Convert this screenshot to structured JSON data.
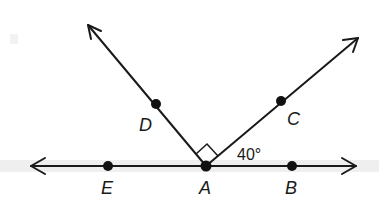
{
  "diagram": {
    "type": "geometry-angles",
    "colors": {
      "ink": "#1a1a1a",
      "band": "#ececec",
      "background": "#ffffff"
    },
    "line": {
      "name": "line EB",
      "y": 166,
      "x1": 31,
      "x2": 356
    },
    "rays": [
      {
        "name": "ray AD",
        "from": "A",
        "through": "D",
        "tip": [
          88,
          25
        ]
      },
      {
        "name": "ray AC",
        "from": "A",
        "through": "C",
        "tip": [
          358,
          38
        ]
      }
    ],
    "points": [
      {
        "id": "E",
        "label": "E",
        "x": 108,
        "y": 166,
        "lx": 107,
        "ly": 194
      },
      {
        "id": "A",
        "label": "A",
        "x": 206,
        "y": 166,
        "lx": 205,
        "ly": 194
      },
      {
        "id": "B",
        "label": "B",
        "x": 292,
        "y": 166,
        "lx": 291,
        "ly": 194
      },
      {
        "id": "D",
        "label": "D",
        "x": 156,
        "y": 104,
        "lx": 146,
        "ly": 131
      },
      {
        "id": "C",
        "label": "C",
        "x": 281,
        "y": 101,
        "lx": 294,
        "ly": 124
      }
    ],
    "angle_marks": [
      {
        "type": "right-angle",
        "between": [
          "AD",
          "AC"
        ],
        "at": "A"
      },
      {
        "type": "measure",
        "between": [
          "AC",
          "AB"
        ],
        "text": "40°",
        "x": 237,
        "y": 160
      }
    ]
  }
}
